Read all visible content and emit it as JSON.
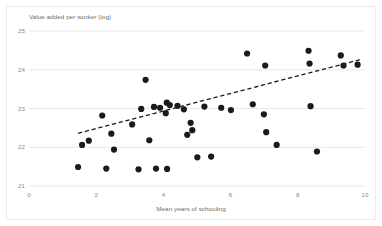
{
  "chart_data": {
    "type": "scatter",
    "title": "",
    "ylabel": "Value added per worker (log)",
    "xlabel": "Mean years of schooling",
    "xlim": [
      0,
      10
    ],
    "ylim": [
      21,
      25
    ],
    "xticks": [
      "0",
      "2",
      "4",
      "6",
      "8",
      "10"
    ],
    "yticks": [
      "21",
      "22",
      "23",
      "24",
      "25"
    ],
    "grid": "horizontal",
    "legend": "none",
    "marker_color": "#1b1b1b",
    "trendline": {
      "style": "dashed",
      "color": "#1b1b1b",
      "x_start": 1.46,
      "y_start": 22.36,
      "x_end": 9.85,
      "y_end": 24.26
    },
    "points": [
      {
        "x": 1.46,
        "y": 21.49
      },
      {
        "x": 1.58,
        "y": 22.06
      },
      {
        "x": 1.78,
        "y": 22.17
      },
      {
        "x": 2.18,
        "y": 22.82
      },
      {
        "x": 2.3,
        "y": 21.45
      },
      {
        "x": 2.45,
        "y": 22.35
      },
      {
        "x": 2.53,
        "y": 21.94
      },
      {
        "x": 3.07,
        "y": 22.59
      },
      {
        "x": 3.26,
        "y": 21.43
      },
      {
        "x": 3.34,
        "y": 22.99
      },
      {
        "x": 3.47,
        "y": 23.74
      },
      {
        "x": 3.58,
        "y": 22.18
      },
      {
        "x": 3.72,
        "y": 23.04
      },
      {
        "x": 3.78,
        "y": 21.45
      },
      {
        "x": 3.9,
        "y": 23.02
      },
      {
        "x": 4.07,
        "y": 22.88
      },
      {
        "x": 4.1,
        "y": 23.15
      },
      {
        "x": 4.11,
        "y": 21.44
      },
      {
        "x": 4.19,
        "y": 23.09
      },
      {
        "x": 4.42,
        "y": 23.07
      },
      {
        "x": 4.61,
        "y": 22.98
      },
      {
        "x": 4.71,
        "y": 22.32
      },
      {
        "x": 4.81,
        "y": 22.63
      },
      {
        "x": 4.86,
        "y": 22.44
      },
      {
        "x": 5.01,
        "y": 21.74
      },
      {
        "x": 5.22,
        "y": 23.05
      },
      {
        "x": 5.42,
        "y": 21.76
      },
      {
        "x": 5.72,
        "y": 23.02
      },
      {
        "x": 6.01,
        "y": 22.96
      },
      {
        "x": 6.49,
        "y": 24.42
      },
      {
        "x": 6.66,
        "y": 23.11
      },
      {
        "x": 6.99,
        "y": 22.85
      },
      {
        "x": 7.03,
        "y": 24.11
      },
      {
        "x": 7.06,
        "y": 22.39
      },
      {
        "x": 7.37,
        "y": 22.06
      },
      {
        "x": 8.32,
        "y": 24.49
      },
      {
        "x": 8.35,
        "y": 24.16
      },
      {
        "x": 8.38,
        "y": 23.06
      },
      {
        "x": 8.57,
        "y": 21.89
      },
      {
        "x": 9.28,
        "y": 24.37
      },
      {
        "x": 9.36,
        "y": 24.11
      },
      {
        "x": 9.78,
        "y": 24.13
      }
    ]
  }
}
